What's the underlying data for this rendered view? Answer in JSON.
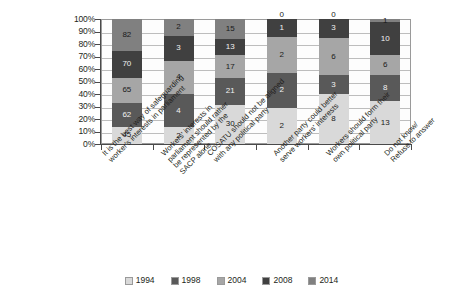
{
  "chart_data": {
    "type": "bar",
    "subtype": "100% stacked column",
    "title": "",
    "subtitle": "",
    "xlabel": "",
    "ylabel": "",
    "ylim": [
      0,
      100
    ],
    "ytick_labels": [
      "100%",
      "90%",
      "80%",
      "70%",
      "60%",
      "50%",
      "40%",
      "30%",
      "20%",
      "10%",
      "0%"
    ],
    "ytick_values": [
      100,
      90,
      80,
      70,
      60,
      50,
      40,
      30,
      20,
      10,
      0
    ],
    "grid": true,
    "legend_position": "bottom",
    "categories": [
      "It is the best way of safeguarding\nworker's interests in parliament",
      "Workers' interests in\nparliament should rather\nbe represented by the\nSACP alone",
      "COSATU should not be aligned\nwith any political party",
      "Another party could better\nserve workers' interests",
      "Workers should form their\nown political party",
      "Do not know/\nRefuse to answer"
    ],
    "series": [
      {
        "name": "1994",
        "color": "#d9d9d9",
        "values": [
          45,
          2,
          30,
          2,
          8,
          13
        ]
      },
      {
        "name": "1998",
        "color": "#595959",
        "values": [
          62,
          4,
          21,
          2,
          3,
          8
        ]
      },
      {
        "name": "2004",
        "color": "#a6a6a6",
        "values": [
          65,
          4,
          17,
          2,
          6,
          6
        ]
      },
      {
        "name": "2008",
        "color": "#404040",
        "values": [
          70,
          3,
          13,
          1,
          3,
          10
        ]
      },
      {
        "name": "2014",
        "color": "#808080",
        "values": [
          82,
          2,
          15,
          0,
          0,
          1
        ]
      }
    ]
  },
  "legend": {
    "items": [
      {
        "label": "1994"
      },
      {
        "label": "1998"
      },
      {
        "label": "2004"
      },
      {
        "label": "2008"
      },
      {
        "label": "2014"
      }
    ]
  }
}
